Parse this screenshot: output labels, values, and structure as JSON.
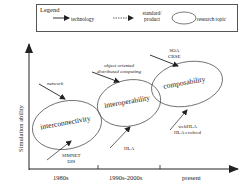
{
  "legend": {
    "title": "Legend",
    "items": [
      {
        "label": "technology",
        "icon": "solid-arrow-icon"
      },
      {
        "label_line1": "standard/",
        "label_line2": "product",
        "icon": "dashed-arrow-icon"
      },
      {
        "label": "research topic",
        "icon": "ellipse-icon"
      }
    ]
  },
  "axes": {
    "y_label": "Simulation ability",
    "x_ticks": [
      "1980s",
      "1990s-2000s",
      "present"
    ]
  },
  "topics": [
    {
      "label": "interconnectivity"
    },
    {
      "label": "interoperability"
    },
    {
      "label": "composability"
    }
  ],
  "annotations": {
    "network": "network",
    "oo_line1": "object oriented",
    "oo_line2": "distributed computing",
    "soa_line1": "SOA",
    "soa_line2": "CBSE",
    "simnet_line1": "SIMNET",
    "simnet_line2": "DIS",
    "hla": "HLA",
    "webhla_line1": "webHLA",
    "webhla_line2": "HLA evolved"
  },
  "colors": {
    "stroke": "#333333",
    "background": "#ffffff"
  }
}
